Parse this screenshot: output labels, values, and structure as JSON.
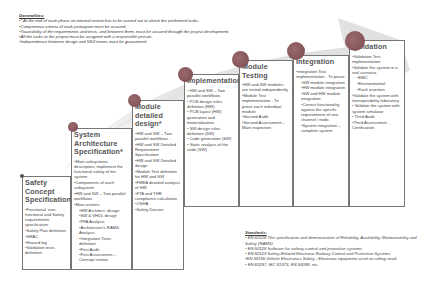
{
  "generalities": {
    "title": "Generalities:",
    "items": [
      "•* At the end of each phase an internal review has to be carried out to check the performed tasks.",
      "•Competence criteria of each participant must be assured.",
      "•Traceability of the requirements and tests, and between them, must be assured through the project development.",
      "•All the tasks to the project must be assigned with a responsible person.",
      "•Independence between design and V&V teams must be guaranteed."
    ]
  },
  "phases": [
    {
      "title": "Safety Concept Specification*",
      "items": [
        {
          "t": "•Functional, non-functional and Safety requirements specification",
          "sub": false
        },
        {
          "t": "•Safety Plan definition",
          "sub": false
        },
        {
          "t": "•SRAC",
          "sub": false
        },
        {
          "t": "•Hazard log",
          "sub": false
        },
        {
          "t": "•Validation tests definition",
          "sub": false
        }
      ]
    },
    {
      "title": "System Architecture Specification*",
      "items": [
        {
          "t": "•Main subsystems description, implement the functional safety of the system",
          "sub": false
        },
        {
          "t": "•Components of each subsystem",
          "sub": false
        },
        {
          "t": "•HW and SW – Two parallel workflows",
          "sub": false
        },
        {
          "t": "•Main actions:",
          "sub": false
        },
        {
          "t": "•HW Architect. design",
          "sub": true
        },
        {
          "t": "•SW & VHDL design",
          "sub": true
        },
        {
          "t": "•PFA Analysis",
          "sub": true
        },
        {
          "t": "•Architecture's RAMS Analysis",
          "sub": true
        },
        {
          "t": "•Integration Tests definition",
          "sub": true
        },
        {
          "t": "•First Audit",
          "sub": true
        },
        {
          "t": "•First Assessment – Concept review",
          "sub": true
        }
      ]
    },
    {
      "title": "Module detailed design*",
      "items": [
        {
          "t": "•HW and SW – Two parallel workflows",
          "sub": false
        },
        {
          "t": "•HW and SW Detailed Requirement Specification",
          "sub": false
        },
        {
          "t": "•HW and SW Detailed design",
          "sub": false
        },
        {
          "t": "•Module Test definition for HW and SW",
          "sub": false
        },
        {
          "t": "•FMEA detailed analysis of HW",
          "sub": false
        },
        {
          "t": "•FTA and THR compliance calculation",
          "sub": false
        },
        {
          "t": "•OSHA",
          "sub": false
        },
        {
          "t": "•Safety Dossier",
          "sub": false
        }
      ]
    },
    {
      "title": "Implementation*",
      "items": [
        {
          "t": "• HW and SW – Two parallel workflows",
          "sub": false
        },
        {
          "t": "• PCB design rules definition (HW)",
          "sub": false
        },
        {
          "t": "• PCB layout (HW) generation and materialization",
          "sub": false
        },
        {
          "t": "• SW design rules definition (SW)",
          "sub": false
        },
        {
          "t": "• Code generation (SW)",
          "sub": false
        },
        {
          "t": "• Static analysis of the code (SW)",
          "sub": false
        }
      ]
    },
    {
      "title": "Module Testing",
      "items": [
        {
          "t": "•HW and SW modules are tested independently",
          "sub": false
        },
        {
          "t": "•Module Test implementation - To prove each individual module",
          "sub": false
        },
        {
          "t": "•Second Audit",
          "sub": false
        },
        {
          "t": "•Second Assessment – Main inspection",
          "sub": false
        }
      ]
    },
    {
      "title": "Integration",
      "items": [
        {
          "t": "•Integration Test implementation - To prove:",
          "sub": false
        },
        {
          "t": "•SW module integration",
          "sub": true
        },
        {
          "t": "•HW module integration",
          "sub": true
        },
        {
          "t": "•SW and HW module integration",
          "sub": true
        },
        {
          "t": "•Correct functionality against the specific requirements of one channel / node.",
          "sub": true
        },
        {
          "t": "•System integration – complete system",
          "sub": true
        }
      ]
    },
    {
      "title": "Validation",
      "items": [
        {
          "t": "•Validation Test implementation",
          "sub": false
        },
        {
          "t": "•Validate the system in a real scenario.",
          "sub": false
        },
        {
          "t": "•EMC",
          "sub": true
        },
        {
          "t": "•Environmental",
          "sub": true
        },
        {
          "t": "•Fault insertion",
          "sub": true
        },
        {
          "t": "•Validate the system with interoperability laboratory",
          "sub": false
        },
        {
          "t": "• Validate the system with system simulator",
          "sub": false
        },
        {
          "t": "• Third Audit",
          "sub": false
        },
        {
          "t": "•Third Assessment - Certification",
          "sub": false
        }
      ]
    }
  ],
  "standards": {
    "title": "Standards:",
    "items": [
      "• EN 50126 The specification and demonstration of Reliability, Availability, Maintainability and Safety (RAMS)",
      "• EN 50128 Software for railway control and protection systems",
      "• EN 50129 Safety-Related Electronic Railway Control and Protection Systems",
      "•EN 50155 Vehicle Electronics Safety - Electronic equipment used on rolling stock",
      "• EN 60297, IEC 61373, EN 50088, etc."
    ]
  },
  "colors": {
    "arrow": "#e6e6e6",
    "circle": "#8a5a60",
    "border": "#777777"
  }
}
